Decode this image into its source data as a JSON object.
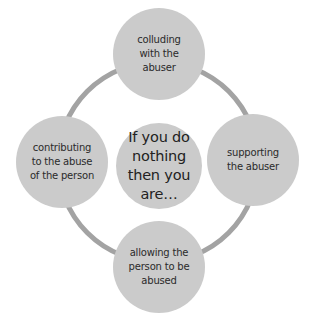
{
  "diagram": {
    "type": "cycle",
    "colors": {
      "circle": "#cbcbcb",
      "ring": "#a3a3a3",
      "text": "#2a2a2a"
    },
    "center": {
      "label": "If you do nothing then you are…",
      "lines": [
        "If you do",
        "nothing",
        "then you",
        "are…"
      ]
    },
    "nodes": [
      {
        "position": "top",
        "lines": [
          "colluding",
          "with the",
          "abuser"
        ]
      },
      {
        "position": "right",
        "lines": [
          "supporting",
          "the abuser"
        ]
      },
      {
        "position": "bottom",
        "lines": [
          "allowing the",
          "person to be",
          "abused"
        ]
      },
      {
        "position": "left",
        "lines": [
          "contributing",
          "to the abuse",
          "of the person"
        ]
      }
    ]
  }
}
